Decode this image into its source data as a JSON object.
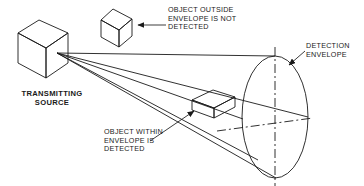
{
  "figure": {
    "type": "technical-line-diagram",
    "background_color": "#ffffff",
    "line_color": "#1a1a1a",
    "text_color": "#1a1a1a"
  },
  "labels": {
    "transmitting_source": "TRANSMITTING\nSOURCE",
    "object_outside": "OBJECT OUTSIDE\nENVELOPE IS NOT\nDETECTED",
    "object_within": "OBJECT WITHIN\nENVELOPE IS\nDETECTED",
    "detection_envelope": "DETECTION\nENVELOPE"
  },
  "shapes": {
    "source_cube": {
      "name": "transmitting-source-cube",
      "top_face": "18,33 39,20 68,33 46,48",
      "left_face": "18,33 46,48 46,78 18,63",
      "right_face": "46,48 68,33 68,63 46,78",
      "apex": [
        57,
        53
      ]
    },
    "outside_cube": {
      "name": "undetected-object-cube",
      "top_face": "101,20 113,9 132,19 119,30",
      "left_face": "101,20 119,30 119,47 101,37",
      "right_face": "119,30 132,19 132,36 119,47"
    },
    "inside_box": {
      "name": "detected-object-box",
      "top_face": "192,100 213,90 234,97 213,108",
      "front_face": "192,100 213,108 213,118 192,110",
      "right_face": "213,108 234,97 234,107 213,118"
    },
    "envelope_ellipse": {
      "name": "detection-envelope-ellipse",
      "cx": 275,
      "cy": 117,
      "rx": 33,
      "ry": 61
    },
    "cone_rays": [
      {
        "from": [
          57,
          53
        ],
        "to": [
          275,
          56
        ]
      },
      {
        "from": [
          57,
          53
        ],
        "to": [
          308,
          117
        ]
      },
      {
        "from": [
          57,
          53
        ],
        "to": [
          275,
          178
        ]
      },
      {
        "from": [
          57,
          53
        ],
        "to": [
          242,
          117
        ]
      },
      {
        "from": [
          57,
          53
        ],
        "to": [
          255,
          152
        ]
      }
    ],
    "centerlines": {
      "vertical": {
        "x": 275,
        "y1": 48,
        "y2": 186,
        "style": "dash-dot"
      },
      "horizontal": {
        "x1": 218,
        "y1": 130,
        "x2": 312,
        "y2": 118,
        "style": "dash-dot"
      }
    },
    "leaders": [
      {
        "name": "leader-outside-object",
        "from": [
          166,
          25
        ],
        "to": [
          136,
          25
        ],
        "arrow": true
      },
      {
        "name": "leader-within-object",
        "from": [
          150,
          140
        ],
        "to": [
          196,
          110
        ],
        "arrow": true
      },
      {
        "name": "leader-detection-envelope",
        "from": [
          304,
          52
        ],
        "to": [
          288,
          66
        ],
        "arrow": true
      }
    ]
  }
}
